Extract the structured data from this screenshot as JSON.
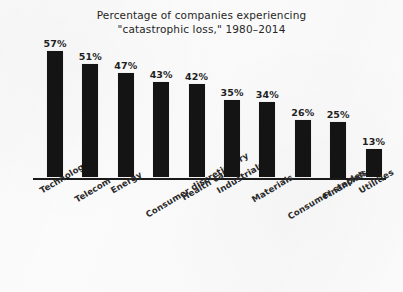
{
  "chart_data": {
    "type": "bar",
    "title": "Percentage of companies experiencing \"catastrophic loss,\" 1980–2014",
    "title_lines": [
      "Percentage of companies experiencing",
      "\"catastrophic loss,\" 1980–2014"
    ],
    "xlabel": "",
    "ylabel": "",
    "ylim": [
      0,
      60
    ],
    "grid": false,
    "legend": "none",
    "value_suffix": "%",
    "bar_color": "#141414",
    "axis_color": "#1a1a1a",
    "background_color": "#fbfbfb",
    "categories": [
      "Technology",
      "Telecom",
      "Energy",
      "Consumer discretionary",
      "Health care",
      "Industrials",
      "Materials",
      "Consumer staples",
      "Financials",
      "Utilities"
    ],
    "values": [
      57,
      51,
      47,
      43,
      42,
      35,
      34,
      26,
      25,
      13
    ],
    "value_labels": [
      "57%",
      "51%",
      "47%",
      "43%",
      "42%",
      "35%",
      "34%",
      "26%",
      "25%",
      "13%"
    ]
  }
}
